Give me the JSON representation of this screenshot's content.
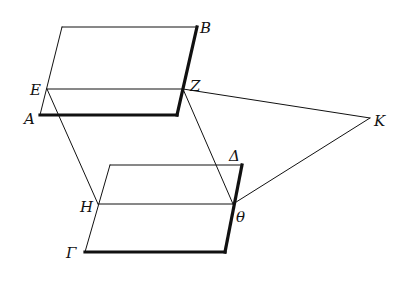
{
  "figure": {
    "type": "geometric-diagram",
    "points": {
      "A": {
        "label": "A",
        "x": 40,
        "y": 115
      },
      "B": {
        "label": "B",
        "x": 197,
        "y": 27
      },
      "E": {
        "label": "E",
        "x": 47,
        "y": 89
      },
      "Z": {
        "label": "Z",
        "x": 183,
        "y": 89
      },
      "Gamma": {
        "label": "Γ",
        "x": 85,
        "y": 252
      },
      "Delta": {
        "label": "Δ",
        "x": 242,
        "y": 165
      },
      "H": {
        "label": "H",
        "x": 98,
        "y": 204
      },
      "Theta": {
        "label": "θ",
        "x": 233,
        "y": 204
      },
      "K": {
        "label": "K",
        "x": 370,
        "y": 118
      }
    },
    "labels": {
      "A": "A",
      "B": "B",
      "E": "E",
      "Z": "Z",
      "Gamma": "Γ",
      "Delta": "Δ",
      "H": "H",
      "Theta": "θ",
      "K": "K"
    }
  }
}
